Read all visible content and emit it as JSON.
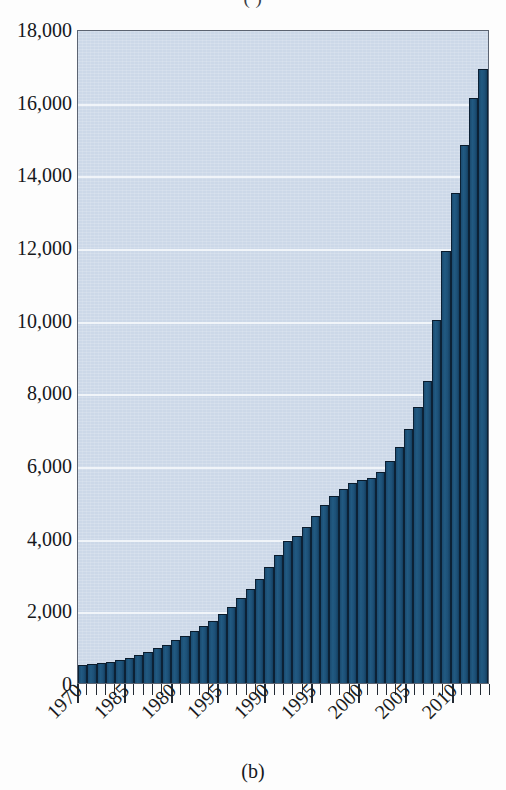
{
  "figure": {
    "caption": "(b)",
    "title_remnant": "(                    )"
  },
  "colors": {
    "bar_fill": "#1d5077",
    "bar_edge": "#0c2135",
    "plot_background": "#ccd8e8",
    "gridline": "#f3f6fa",
    "axis": "#232a33",
    "text": "#16181c"
  },
  "chart_data": {
    "type": "bar",
    "title": "",
    "xlabel": "",
    "ylabel": "",
    "ylim": [
      0,
      18000
    ],
    "ytick_labels": [
      "18,000",
      "16,000",
      "14,000",
      "12,000",
      "10,000",
      "8,000",
      "6,000",
      "4,000",
      "2,000",
      "0"
    ],
    "ytick_values": [
      18000,
      16000,
      14000,
      12000,
      10000,
      8000,
      6000,
      4000,
      2000,
      0
    ],
    "ytick_step": 2000,
    "grid": true,
    "legend": "none",
    "xtick_labels": [
      "1970",
      "1985",
      "1980",
      "1995",
      "1990",
      "1995",
      "2000",
      "2005",
      "2010"
    ],
    "xtick_interval_years": 5,
    "minor_ticks_per_major": 5,
    "categories": [
      "1970",
      "1971",
      "1972",
      "1973",
      "1974",
      "1975",
      "1976",
      "1977",
      "1978",
      "1979",
      "1980",
      "1981",
      "1982",
      "1983",
      "1984",
      "1985",
      "1986",
      "1987",
      "1988",
      "1989",
      "1990",
      "1991",
      "1992",
      "1993",
      "1994",
      "1995",
      "1996",
      "1997",
      "1998",
      "1999",
      "2000",
      "2001",
      "2002",
      "2003",
      "2004",
      "2005",
      "2006",
      "2007",
      "2008",
      "2009",
      "2010",
      "2011",
      "2012",
      "2013"
    ],
    "values": [
      500,
      510,
      540,
      570,
      620,
      680,
      760,
      850,
      950,
      1060,
      1180,
      1300,
      1420,
      1560,
      1720,
      1900,
      2100,
      2330,
      2580,
      2860,
      3180,
      3520,
      3900,
      4050,
      4300,
      4600,
      4900,
      5150,
      5350,
      5500,
      5600,
      5650,
      5800,
      6100,
      6500,
      7000,
      7600,
      8300,
      10000,
      11900,
      13500,
      14800,
      16100,
      16900
    ],
    "series_name": "annual value",
    "value_max": 16900,
    "value_min": 500,
    "bar_count": 44
  }
}
